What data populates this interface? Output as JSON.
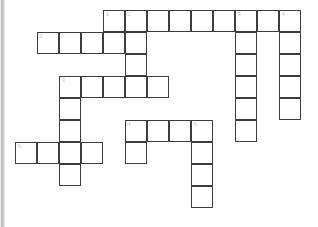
{
  "puzzle": {
    "title": "Crossword Puzzle Grid",
    "type": "crossword",
    "cell_size_px": 22,
    "origin_x_px": 15,
    "origin_y_px": 10,
    "grid_cols": 14,
    "grid_rows": 10,
    "colors": {
      "cell_fill": "#ffffff",
      "cell_border": "#3c3c3c",
      "number_text": "#c8c8c8",
      "page_background": "#ffffff",
      "gutter_shade": "#b8b8b8"
    },
    "numbers_visible": [
      "1",
      "2",
      "3",
      "4",
      "5",
      "1",
      "2",
      "3",
      "4",
      "5"
    ],
    "entries": [
      {
        "number": "1",
        "direction": "across",
        "row": 0,
        "col": 4,
        "length": 9
      },
      {
        "number": "2",
        "direction": "across",
        "row": 1,
        "col": 1,
        "length": 5
      },
      {
        "number": "3",
        "direction": "across",
        "row": 3,
        "col": 2,
        "length": 5
      },
      {
        "number": "4",
        "direction": "across",
        "row": 5,
        "col": 5,
        "length": 4
      },
      {
        "number": "5",
        "direction": "across",
        "row": 6,
        "col": 0,
        "length": 4
      },
      {
        "number": "2",
        "direction": "down",
        "row": 0,
        "col": 5,
        "length": 4
      },
      {
        "number": "3",
        "direction": "down",
        "row": 0,
        "col": 10,
        "length": 6
      },
      {
        "number": "4",
        "direction": "down",
        "row": 0,
        "col": 12,
        "length": 5
      },
      {
        "number": "1",
        "direction": "down",
        "row": 3,
        "col": 2,
        "length": 5
      },
      {
        "number": "5",
        "direction": "down",
        "row": 5,
        "col": 8,
        "length": 4
      }
    ],
    "cells": [
      {
        "row": 0,
        "col": 4,
        "number": "1"
      },
      {
        "row": 0,
        "col": 5,
        "number": "2"
      },
      {
        "row": 0,
        "col": 6,
        "number": ""
      },
      {
        "row": 0,
        "col": 7,
        "number": ""
      },
      {
        "row": 0,
        "col": 8,
        "number": ""
      },
      {
        "row": 0,
        "col": 9,
        "number": ""
      },
      {
        "row": 0,
        "col": 10,
        "number": "3"
      },
      {
        "row": 0,
        "col": 11,
        "number": ""
      },
      {
        "row": 0,
        "col": 12,
        "number": "4"
      },
      {
        "row": 1,
        "col": 1,
        "number": "2"
      },
      {
        "row": 1,
        "col": 2,
        "number": ""
      },
      {
        "row": 1,
        "col": 3,
        "number": ""
      },
      {
        "row": 1,
        "col": 4,
        "number": ""
      },
      {
        "row": 1,
        "col": 5,
        "number": ""
      },
      {
        "row": 1,
        "col": 10,
        "number": ""
      },
      {
        "row": 1,
        "col": 12,
        "number": ""
      },
      {
        "row": 2,
        "col": 5,
        "number": ""
      },
      {
        "row": 2,
        "col": 10,
        "number": ""
      },
      {
        "row": 2,
        "col": 12,
        "number": ""
      },
      {
        "row": 3,
        "col": 2,
        "number": "3"
      },
      {
        "row": 3,
        "col": 3,
        "number": ""
      },
      {
        "row": 3,
        "col": 4,
        "number": ""
      },
      {
        "row": 3,
        "col": 5,
        "number": ""
      },
      {
        "row": 3,
        "col": 6,
        "number": ""
      },
      {
        "row": 3,
        "col": 10,
        "number": ""
      },
      {
        "row": 3,
        "col": 12,
        "number": ""
      },
      {
        "row": 4,
        "col": 2,
        "number": ""
      },
      {
        "row": 4,
        "col": 10,
        "number": ""
      },
      {
        "row": 4,
        "col": 12,
        "number": ""
      },
      {
        "row": 5,
        "col": 2,
        "number": ""
      },
      {
        "row": 5,
        "col": 5,
        "number": "4"
      },
      {
        "row": 5,
        "col": 6,
        "number": ""
      },
      {
        "row": 5,
        "col": 7,
        "number": ""
      },
      {
        "row": 5,
        "col": 8,
        "number": "5"
      },
      {
        "row": 5,
        "col": 10,
        "number": ""
      },
      {
        "row": 6,
        "col": 0,
        "number": "5"
      },
      {
        "row": 6,
        "col": 1,
        "number": ""
      },
      {
        "row": 6,
        "col": 2,
        "number": ""
      },
      {
        "row": 6,
        "col": 3,
        "number": ""
      },
      {
        "row": 6,
        "col": 5,
        "number": ""
      },
      {
        "row": 6,
        "col": 8,
        "number": ""
      },
      {
        "row": 7,
        "col": 2,
        "number": ""
      },
      {
        "row": 7,
        "col": 8,
        "number": ""
      },
      {
        "row": 8,
        "col": 8,
        "number": ""
      }
    ]
  }
}
